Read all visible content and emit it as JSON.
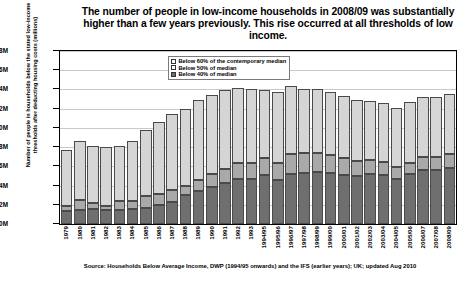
{
  "chart_title": "The number of people in low-income households in 2008/09 was substantially higher than a few years previously.  This rise occurred at all thresholds of low income.",
  "y_axis_title": "Number of people in households below the stated low-income thresholds after deducting housing costs (millions)",
  "source_note": "Source: Households Below Average Income, DWP (1994/95 onwards) and the IFS (earlier years); UK; updated Aug 2010",
  "legend": {
    "items": [
      {
        "label": "Below 60% of the contemporary median",
        "key": "below60",
        "color": "#d5d5d5"
      },
      {
        "label": "Below 50% of median",
        "key": "below50",
        "color": "#a9a9a9"
      },
      {
        "label": "Below 40% of median",
        "key": "below40",
        "color": "#6f6f6f"
      }
    ]
  },
  "chart_data": {
    "type": "bar",
    "stacked": true,
    "title": "The number of people in low-income households in 2008/09 was substantially higher than a few years previously.  This rise occurred at all thresholds of low income.",
    "xlabel": "",
    "ylabel": "Number of people in households below the stated low-income thresholds after deducting housing costs (millions)",
    "ylim": [
      0,
      18
    ],
    "yunit": "M",
    "ytick_labels": [
      "0M",
      "2M",
      "4M",
      "6M",
      "8M",
      "10M",
      "12M",
      "14M",
      "16M",
      "18M"
    ],
    "ytick_values": [
      0,
      2,
      4,
      6,
      8,
      10,
      12,
      14,
      16,
      18
    ],
    "grid": true,
    "legend_position": "top-center",
    "categories": [
      "1979",
      "1980",
      "1981",
      "1982",
      "1983",
      "1984",
      "1985",
      "1986",
      "1987",
      "1988",
      "1989",
      "1990",
      "1991",
      "1992",
      "1993",
      "1994/95",
      "1995/96",
      "1996/97",
      "1997/98",
      "1998/99",
      "1999/00",
      "2000/01",
      "2001/02",
      "2002/03",
      "2003/04",
      "2004/05",
      "2005/06",
      "2006/07",
      "2007/08",
      "2008/09"
    ],
    "series": [
      {
        "name": "Below 40% of median",
        "color": "#6f6f6f",
        "values": [
          1.4,
          1.5,
          1.6,
          1.5,
          1.5,
          1.6,
          1.7,
          2.0,
          2.3,
          3.0,
          3.4,
          3.9,
          4.3,
          4.7,
          4.7,
          5.1,
          4.6,
          5.2,
          5.3,
          5.4,
          5.3,
          5.1,
          5.0,
          5.2,
          5.1,
          4.7,
          5.2,
          5.6,
          5.6,
          5.8
        ]
      },
      {
        "name": "Below 50% of median",
        "color": "#a9a9a9",
        "values": [
          1.9,
          2.5,
          2.2,
          1.9,
          2.4,
          2.4,
          2.9,
          3.1,
          3.5,
          4.0,
          4.6,
          5.2,
          5.7,
          6.3,
          6.4,
          6.9,
          6.4,
          7.3,
          7.4,
          7.4,
          7.2,
          6.9,
          6.6,
          6.7,
          6.5,
          5.9,
          6.4,
          7.0,
          7.0,
          7.3
        ]
      },
      {
        "name": "Below 60% of the contemporary median",
        "color": "#d5d5d5",
        "values": [
          7.7,
          8.6,
          8.1,
          8.0,
          8.1,
          8.6,
          9.8,
          10.6,
          11.4,
          12.0,
          12.9,
          13.4,
          13.9,
          14.2,
          14.1,
          13.9,
          13.7,
          14.4,
          14.1,
          14.0,
          13.7,
          13.3,
          12.9,
          12.8,
          12.6,
          12.1,
          12.7,
          13.2,
          13.2,
          13.5
        ]
      }
    ]
  }
}
